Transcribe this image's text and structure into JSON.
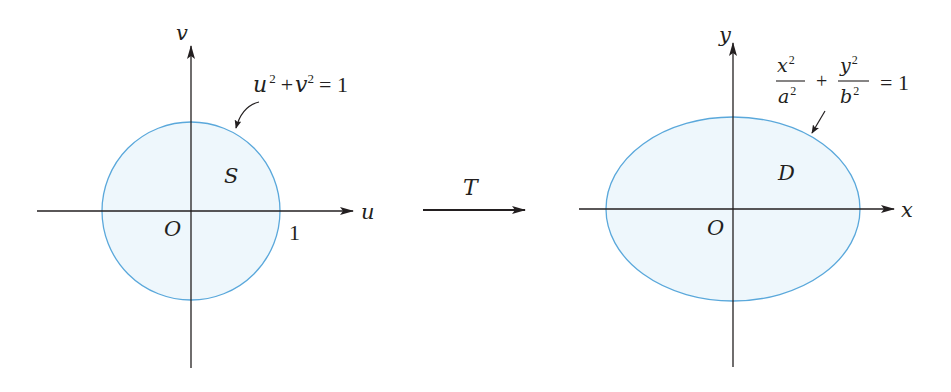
{
  "colors": {
    "region_fill": "#eef7fc",
    "curve_stroke": "#5aa8db",
    "axis": "#231f20"
  },
  "left_panel": {
    "horizontal_axis_label": "u",
    "vertical_axis_label": "v",
    "origin_label": "O",
    "region_label": "S",
    "intercept_label": "1",
    "curve_equation": {
      "u": "u",
      "u_exp": "2",
      "plus": "+",
      "v": "v",
      "v_exp": "2",
      "equals": "= 1"
    }
  },
  "transformation": {
    "label": "T"
  },
  "right_panel": {
    "horizontal_axis_label": "x",
    "vertical_axis_label": "y",
    "origin_label": "O",
    "region_label": "D",
    "curve_equation": {
      "term1_num": "x",
      "term1_num_exp": "2",
      "term1_den": "a",
      "term1_den_exp": "2",
      "plus": "+",
      "term2_num": "y",
      "term2_num_exp": "2",
      "term2_den": "b",
      "term2_den_exp": "2",
      "equals": "= 1"
    }
  }
}
